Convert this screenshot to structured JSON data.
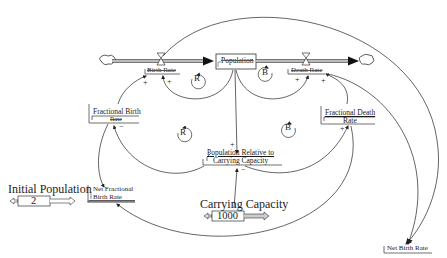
{
  "diagram": {
    "type": "stock-and-flow",
    "stock": {
      "label": "Population"
    },
    "flows": [
      {
        "id": "birth",
        "label": "Birth Rate"
      },
      {
        "id": "death",
        "label": "Death Rate"
      }
    ],
    "auxiliaries": {
      "fractional_birth_rate": {
        "line1": "Fractional Birth",
        "line2": "Rate"
      },
      "fractional_death_rate": {
        "line1": "Fractional Death",
        "line2": "Rate"
      },
      "population_relative": {
        "line1": "Population Relative to",
        "line2": "Carrying Capacity"
      },
      "net_fractional_birth_rate": {
        "line1": "Net Fractional",
        "line2": "Birth Rate"
      },
      "net_birth_rate": {
        "label": "Net Birth Rate"
      }
    },
    "constants": {
      "initial_population": {
        "label": "Initial Population",
        "value": "2"
      },
      "carrying_capacity": {
        "label": "Carrying Capacity",
        "value": "1000"
      }
    },
    "loops": [
      {
        "id": "loop-r-top",
        "letter": "R"
      },
      {
        "id": "loop-b-top",
        "letter": "B"
      },
      {
        "id": "loop-r-mid",
        "letter": "R"
      },
      {
        "id": "loop-b-mid",
        "letter": "B"
      }
    ],
    "polarities": {
      "birth_left": "+",
      "birth_right": "+",
      "death_left": "+",
      "death_right": "+",
      "fbr_minus": "−",
      "fdr_plus": "+",
      "prc_plus": "+",
      "prc_minus": "−"
    }
  }
}
